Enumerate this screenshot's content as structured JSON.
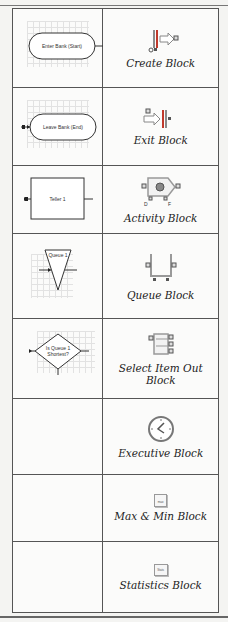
{
  "table": {
    "rows": [
      {
        "diagram": {
          "type": "start-terminal",
          "text": "Enter Bank (Start)"
        },
        "icon": "create-block-icon",
        "label": "Create Block"
      },
      {
        "diagram": {
          "type": "end-terminal",
          "text": "Leave Bank (End)"
        },
        "icon": "exit-block-icon",
        "label": "Exit Block"
      },
      {
        "diagram": {
          "type": "process-box",
          "text": "Teller 1"
        },
        "icon": "activity-block-icon",
        "label": "Activity Block"
      },
      {
        "diagram": {
          "type": "queue-triangle",
          "text": "Queue 1"
        },
        "icon": "queue-block-icon",
        "label": "Queue Block"
      },
      {
        "diagram": {
          "type": "decision-diamond",
          "text": "Is Queue 1 Shortest?"
        },
        "icon": "select-item-out-block-icon",
        "label": "Select Item Out Block"
      },
      {
        "diagram": {
          "type": "none",
          "text": ""
        },
        "icon": "executive-block-icon",
        "label": "Executive Block"
      },
      {
        "diagram": {
          "type": "none",
          "text": ""
        },
        "icon": "max-min-block-icon",
        "icon_text": "max",
        "label": "Max & Min Block"
      },
      {
        "diagram": {
          "type": "none",
          "text": ""
        },
        "icon": "statistics-block-icon",
        "icon_text": "Stats",
        "label": "Statistics Block"
      }
    ]
  },
  "colors": {
    "border": "#555555",
    "icon_gray": "#8a8a8a",
    "icon_red": "#c0392b",
    "icon_green": "#5a8a5a"
  }
}
